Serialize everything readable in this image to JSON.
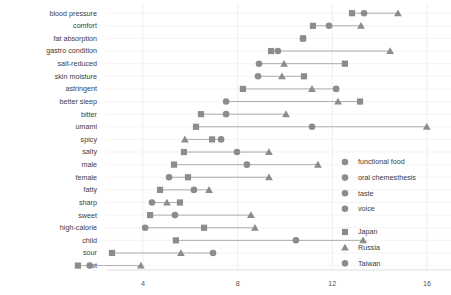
{
  "chart_data": {
    "type": "scatter",
    "title": "",
    "subtitle": "",
    "xlabel": "",
    "ylabel": "",
    "xlim": [
      2.2,
      16.8
    ],
    "ylim": null,
    "grid": true,
    "legend_position": "right",
    "xticks": [
      4,
      8,
      12,
      16
    ],
    "xtick_labels": [
      "4",
      "8",
      "12",
      "16"
    ],
    "categories": [
      "blood pressure",
      "comfort",
      "fat absorption",
      "gastro condition",
      "salt-reduced",
      "skin moisture",
      "astringent",
      "better sleep",
      "bitter",
      "umami",
      "spicy",
      "salty",
      "male",
      "female",
      "fatty",
      "sharp",
      "sweet",
      "high-calorie",
      "child",
      "sour",
      "hot"
    ],
    "group_legend": [
      {
        "label": "functional food",
        "marker": "circle",
        "color": "#8c8c8c"
      },
      {
        "label": "oral chemesthesis",
        "marker": "circle",
        "color": "#8c8c8c"
      },
      {
        "label": "taste",
        "marker": "circle",
        "color": "#8c8c8c"
      },
      {
        "label": "voice",
        "marker": "circle",
        "color": "#8c8c8c"
      }
    ],
    "series": [
      {
        "name": "Japan",
        "marker": "square",
        "color": "#8c8c8c"
      },
      {
        "name": "Russia",
        "marker": "triangle",
        "color": "#8c8c8c"
      },
      {
        "name": "Taiwan",
        "marker": "circle",
        "color": "#8c8c8c"
      }
    ],
    "rows": [
      {
        "category": "blood pressure",
        "Japan": 12.83,
        "Taiwan": 13.34,
        "Russia": 14.77
      },
      {
        "category": "comfort",
        "Japan": 11.18,
        "Taiwan": 11.86,
        "Russia": 13.21
      },
      {
        "category": "fat absorption",
        "Japan": 10.76,
        "Taiwan": 10.76,
        "Russia": null
      },
      {
        "category": "gastro condition",
        "Japan": 9.41,
        "Taiwan": 9.7,
        "Russia": 14.44
      },
      {
        "category": "salt-reduced",
        "Taiwan": 8.9,
        "Russia": 9.96,
        "Japan": 12.53
      },
      {
        "category": "skin moisture",
        "Taiwan": 8.86,
        "Russia": 9.87,
        "Japan": 10.8
      },
      {
        "category": "astringent",
        "Japan": 8.22,
        "Russia": 11.14,
        "Taiwan": 12.16
      },
      {
        "category": "better sleep",
        "Taiwan": 7.51,
        "Russia": 12.24,
        "Japan": 13.17
      },
      {
        "category": "bitter",
        "Japan": 6.45,
        "Taiwan": 7.51,
        "Russia": 10.04
      },
      {
        "category": "umami",
        "Japan": 6.24,
        "Taiwan": 11.14,
        "Russia": 15.99
      },
      {
        "category": "spicy",
        "Russia": 5.77,
        "Japan": 6.92,
        "Taiwan": 7.3
      },
      {
        "category": "salty",
        "Japan": 5.73,
        "Taiwan": 7.97,
        "Russia": 9.32
      },
      {
        "category": "male",
        "Japan": 5.31,
        "Taiwan": 8.39,
        "Russia": 11.39
      },
      {
        "category": "female",
        "Taiwan": 5.1,
        "Japan": 5.9,
        "Russia": 9.32
      },
      {
        "category": "fatty",
        "Japan": 4.72,
        "Taiwan": 6.15,
        "Russia": 6.79
      },
      {
        "category": "sharp",
        "Taiwan": 4.38,
        "Russia": 5.01,
        "Japan": 5.56
      },
      {
        "category": "sweet",
        "Japan": 4.3,
        "Taiwan": 5.35,
        "Russia": 8.56
      },
      {
        "category": "high-calorie",
        "Taiwan": 4.09,
        "Japan": 6.58,
        "Russia": 8.73
      },
      {
        "category": "child",
        "Japan": 5.39,
        "Taiwan": 10.46,
        "Russia": 13.3
      },
      {
        "category": "sour",
        "Japan": 2.69,
        "Russia": 5.6,
        "Taiwan": 6.96
      },
      {
        "category": "hot",
        "Japan": 1.25,
        "Taiwan": 1.75,
        "Russia": 3.91
      }
    ]
  },
  "legend": {
    "groups": [
      {
        "label": "functional food"
      },
      {
        "label": "oral chemesthesis"
      },
      {
        "label": "taste"
      },
      {
        "label": "voice"
      }
    ],
    "countries": [
      {
        "label": "Japan"
      },
      {
        "label": "Russia"
      },
      {
        "label": "Taiwan"
      }
    ]
  },
  "colors": {
    "marker": "#8c8c8c",
    "connector": "#9a9a9a",
    "grid": "#e8e8e8",
    "text": "#3c3c3c"
  }
}
